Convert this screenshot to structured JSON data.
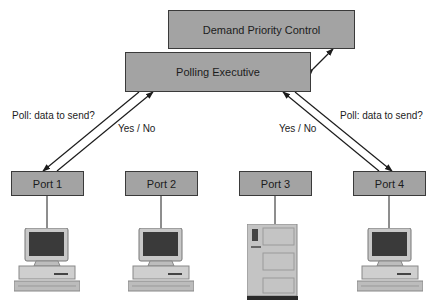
{
  "diagram": {
    "top_box": "Demand Priority Control",
    "exec_box": "Polling Executive",
    "left_poll_label": "Poll: data to send?",
    "left_reply_label": "Yes / No",
    "right_poll_label": "Poll: data to send?",
    "right_reply_label": "Yes / No",
    "ports": [
      {
        "label": "Port 1",
        "device": "desktop-computer"
      },
      {
        "label": "Port 2",
        "device": "desktop-computer"
      },
      {
        "label": "Port 3",
        "device": "server"
      },
      {
        "label": "Port 4",
        "device": "desktop-computer"
      }
    ],
    "colors": {
      "box_fill": "#a3a3a3",
      "border": "#3a3a3a",
      "line": "#1c1c1c"
    }
  }
}
